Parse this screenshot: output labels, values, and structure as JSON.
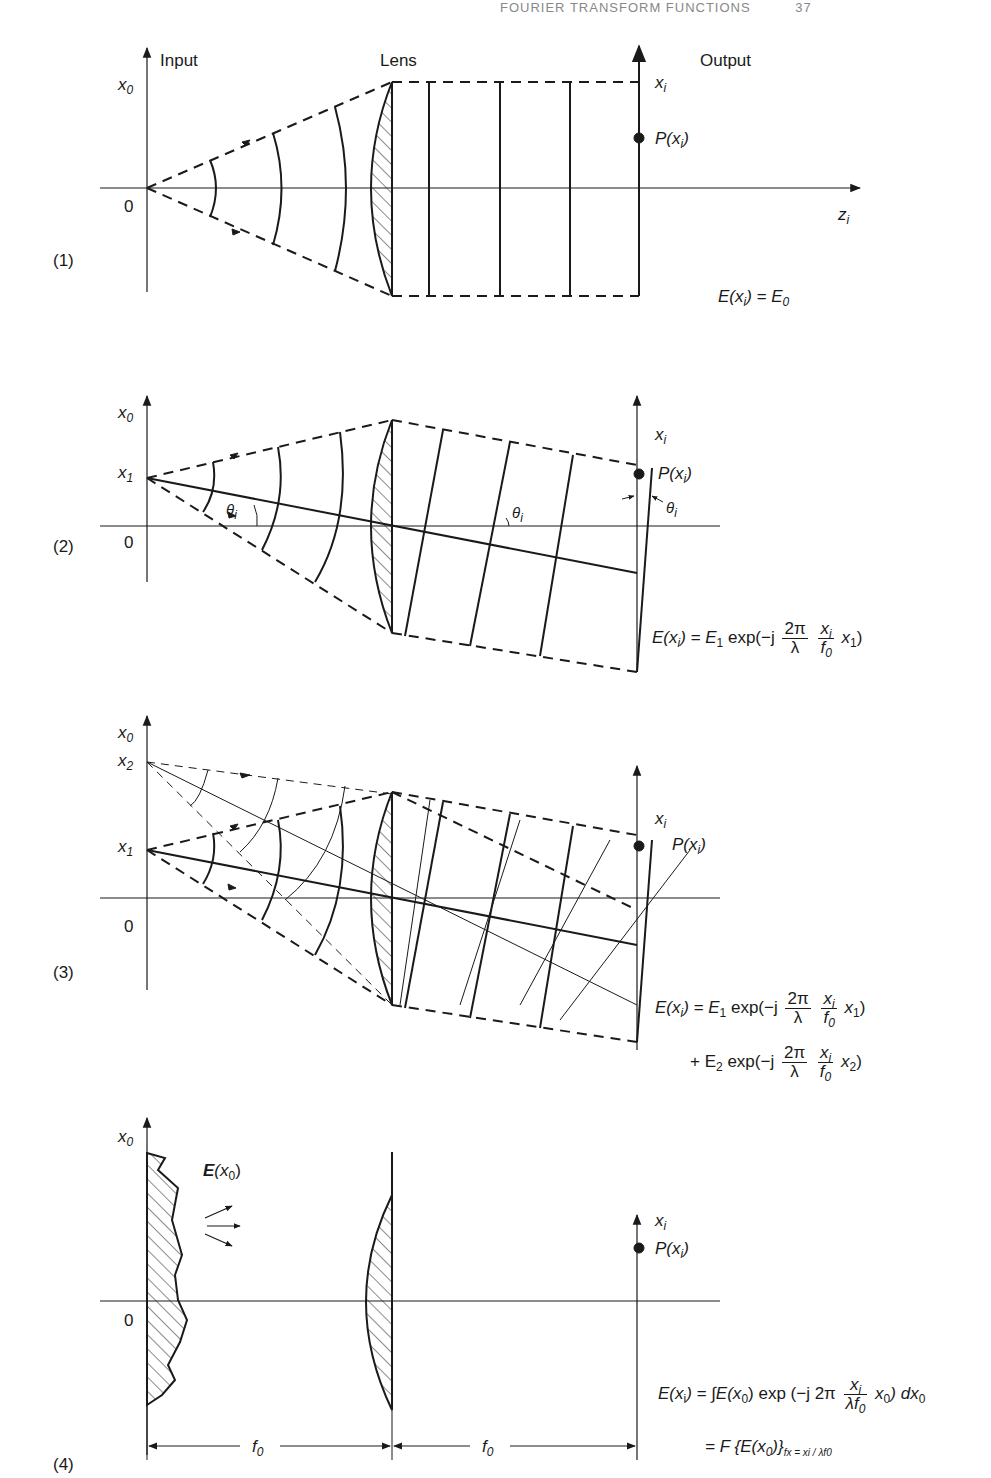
{
  "header": {
    "running_title": "FOURIER TRANSFORM FUNCTIONS",
    "page_number": "37"
  },
  "panels": [
    {
      "id": "1",
      "label": "(1)",
      "input_label": "Input",
      "lens_label": "Lens",
      "output_label": "Output",
      "axis_x0": "x",
      "axis_x0_sub": "0",
      "origin": "0",
      "axis_xi": "x",
      "axis_xi_sub": "i",
      "axis_zi": "z",
      "axis_zi_sub": "i",
      "point": "P(x",
      "point_sub": "i",
      "point_end": ")",
      "equation": "E(x",
      "equation_rest": ") = E",
      "equation_sub": "0"
    },
    {
      "id": "2",
      "label": "(2)",
      "axis_x0": "x",
      "axis_x0_sub": "0",
      "source": "x",
      "source_sub": "1",
      "origin": "0",
      "axis_xi": "x",
      "axis_xi_sub": "i",
      "point": "P(x",
      "point_sub": "i",
      "point_end": ")",
      "theta": "θ",
      "theta_sub": "i",
      "eq_lhs": "E(x",
      "eq_lhs_sub": "i",
      "eq_mid": ") = E",
      "eq_mid_sub": "1",
      "eq_exp": " exp(−j ",
      "frac1_n": "2π",
      "frac1_d": "λ",
      "frac2_n": "x",
      "frac2_n_sub": "i",
      "frac2_d": "f",
      "frac2_d_sub": "0",
      "eq_tail": " x",
      "eq_tail_sub": "1",
      "eq_close": ")"
    },
    {
      "id": "3",
      "label": "(3)",
      "axis_x0": "x",
      "axis_x0_sub": "0",
      "source2": "x",
      "source2_sub": "2",
      "source1": "x",
      "source1_sub": "1",
      "origin": "0",
      "axis_xi": "x",
      "axis_xi_sub": "i",
      "point": "P(x",
      "point_sub": "i",
      "point_end": ")",
      "line1_lhs": "E(x",
      "line1_lhs_sub": "i",
      "line1_mid": ") = E",
      "line1_mid_sub": "1",
      "line1_exp": " exp(−j ",
      "line1_tail": " x",
      "line1_tail_sub": "1",
      "line2_lead": "+ E",
      "line2_lead_sub": "2",
      "line2_exp": " exp(−j ",
      "line2_tail": " x",
      "line2_tail_sub": "2",
      "frac1_n": "2π",
      "frac1_d": "λ",
      "frac2_n": "x",
      "frac2_n_sub": "i",
      "frac2_d": "f",
      "frac2_d_sub": "0",
      "close": ")"
    },
    {
      "id": "4",
      "label": "(4)",
      "axis_x0": "x",
      "axis_x0_sub": "0",
      "origin": "0",
      "field": "E",
      "field_rest": "(x",
      "field_sub": "0",
      "field_end": ")",
      "axis_xi": "x",
      "axis_xi_sub": "i",
      "point": "P(x",
      "point_sub": "i",
      "point_end": ")",
      "f_label": "f",
      "f_sub": "0",
      "eq1_lhs": "E(x",
      "eq1_lhs_sub": "i",
      "eq1_mid": ") = ∫E(x",
      "eq1_mid_sub": "0",
      "eq1_exp": ") exp (−j 2π",
      "eq1_frac_n": "x",
      "eq1_frac_n_sub": "i",
      "eq1_frac_d": "λf",
      "eq1_frac_d_sub": "0",
      "eq1_tail": "x",
      "eq1_tail_sub": "0",
      "eq1_end": ") dx",
      "eq1_end_sub": "0",
      "eq2": "= F {E(x",
      "eq2_sub": "0",
      "eq2_end": ")}",
      "eq2_cond": "f",
      "eq2_cond_sub": "x",
      "eq2_cond_rest": " = x",
      "eq2_cond_sub2": "i",
      "eq2_cond_tail": " / λf",
      "eq2_cond_sub3": "0"
    }
  ]
}
